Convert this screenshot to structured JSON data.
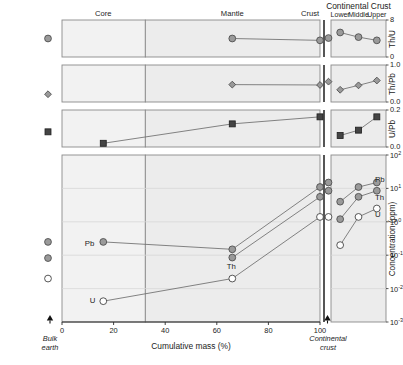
{
  "figure": {
    "title": "",
    "group_header": "Continental Crust",
    "reservoir_labels": [
      {
        "text": "Core",
        "x_pct": 16
      },
      {
        "text": "Mantle",
        "x_pct": 66
      },
      {
        "text": "Crust",
        "x_pct": 100
      }
    ],
    "cc_sublabels": [
      "Lower",
      "Middle",
      "Upper"
    ],
    "xaxis": {
      "label": "Cumulative mass (%)",
      "ticks": [
        "0",
        "20",
        "40",
        "60",
        "80",
        "100"
      ],
      "tick_values": [
        0,
        20,
        40,
        60,
        80,
        100
      ],
      "range": [
        0,
        100
      ],
      "left_endpoint_label": [
        "Bulk",
        "earth"
      ],
      "right_endpoint_label": [
        "Continental",
        "crust"
      ]
    },
    "panel_divider_x_pct": 32.3,
    "point_labels": [
      "Pb",
      "Th",
      "U"
    ],
    "legend_note": ""
  },
  "chart_data": [
    {
      "id": "th-u",
      "type": "line",
      "title": "",
      "ylabel": "Th/U",
      "ylim": [
        0,
        8
      ],
      "yticks": [
        0,
        8
      ],
      "ytick_labels": [
        "0",
        "8"
      ],
      "grid": false,
      "xlabel": "",
      "xlim": [
        0,
        100
      ],
      "marker": "filled-circle",
      "series": [
        {
          "name": "Th/U main",
          "x": [
            66,
            100
          ],
          "y": [
            4.0,
            3.6
          ],
          "x_labels": [
            "Mantle",
            "Crust"
          ]
        }
      ],
      "bulk_earth_point": {
        "y": 4.0
      },
      "crust_extra_point": {
        "y": 4.1
      },
      "cc_panel": {
        "categories": [
          "Lower",
          "Middle",
          "Upper"
        ],
        "values": [
          5.3,
          4.3,
          3.6
        ]
      }
    },
    {
      "id": "th-pb",
      "type": "line",
      "title": "",
      "ylabel": "Th/Pb",
      "ylim": [
        0.0,
        1.0
      ],
      "yticks": [
        0.0,
        1.0
      ],
      "ytick_labels": [
        "0.0",
        "1.0"
      ],
      "grid": false,
      "xlabel": "",
      "xlim": [
        0,
        100
      ],
      "marker": "filled-diamond",
      "series": [
        {
          "name": "Th/Pb main",
          "x": [
            66,
            100
          ],
          "y": [
            0.47,
            0.46
          ],
          "x_labels": [
            "Mantle",
            "Crust"
          ]
        }
      ],
      "bulk_earth_point": {
        "y": 0.21
      },
      "crust_extra_point": {
        "y": 0.55
      },
      "cc_panel": {
        "categories": [
          "Lower",
          "Middle",
          "Upper"
        ],
        "values": [
          0.33,
          0.45,
          0.58
        ]
      }
    },
    {
      "id": "u-pb",
      "type": "line",
      "title": "",
      "ylabel": "U/Pb",
      "ylim": [
        0.0,
        0.2
      ],
      "yticks": [
        0.0,
        0.2
      ],
      "ytick_labels": [
        "0.0",
        "0.2"
      ],
      "grid": false,
      "xlabel": "",
      "xlim": [
        0,
        100
      ],
      "marker": "filled-square",
      "series": [
        {
          "name": "U/Pb main",
          "x": [
            16,
            66,
            100
          ],
          "y": [
            0.02,
            0.125,
            0.163
          ],
          "x_labels": [
            "Core",
            "Mantle",
            "Crust"
          ]
        }
      ],
      "bulk_earth_point": {
        "y": 0.082
      },
      "cc_panel": {
        "categories": [
          "Lower",
          "Middle",
          "Upper"
        ],
        "values": [
          0.062,
          0.091,
          0.163
        ]
      }
    },
    {
      "id": "concentration",
      "type": "line",
      "title": "",
      "ylabel": "Concentration (ppm)",
      "yscale": "log",
      "ylim": [
        0.001,
        100
      ],
      "yticks": [
        0.001,
        0.01,
        0.1,
        1,
        10,
        100
      ],
      "ytick_labels": [
        "10-3",
        "10-2",
        "10-1",
        "100",
        "101",
        "102"
      ],
      "ytick_exponents": [
        "-3",
        "-2",
        "-1",
        "0",
        "1",
        "2"
      ],
      "grid": true,
      "xlabel": "Cumulative mass (%)",
      "xlim": [
        0,
        100
      ],
      "series": [
        {
          "name": "Pb",
          "marker": "filled-circle",
          "x": [
            16,
            66,
            100
          ],
          "y": [
            0.25,
            0.15,
            11.0
          ],
          "label": "Pb"
        },
        {
          "name": "Th",
          "marker": "filled-circle",
          "x": [
            66,
            100
          ],
          "y": [
            0.085,
            5.6
          ],
          "label": "Th"
        },
        {
          "name": "U",
          "marker": "open-circle",
          "x": [
            16,
            66,
            100
          ],
          "y": [
            0.0042,
            0.02,
            1.4
          ],
          "label": "U"
        }
      ],
      "bulk_earth_points": [
        {
          "name": "Pb",
          "marker": "filled-circle",
          "y": 0.25
        },
        {
          "name": "Th",
          "marker": "filled-circle",
          "y": 0.082
        },
        {
          "name": "U",
          "marker": "open-circle",
          "y": 0.02
        }
      ],
      "crust_extra_points": [
        {
          "name": "Pb",
          "marker": "filled-circle",
          "y": 15.0
        },
        {
          "name": "Th",
          "marker": "filled-circle",
          "y": 8.5
        },
        {
          "name": "U",
          "marker": "open-circle",
          "y": 1.4
        }
      ],
      "cc_panel": {
        "categories": [
          "Lower",
          "Middle",
          "Upper"
        ],
        "series": [
          {
            "name": "Pb",
            "marker": "filled-circle",
            "values": [
              4.0,
              11.0,
              15.0
            ]
          },
          {
            "name": "Th",
            "marker": "filled-circle",
            "values": [
              1.2,
              5.6,
              8.5
            ]
          },
          {
            "name": "U",
            "marker": "open-circle",
            "values": [
              0.2,
              1.4,
              2.5
            ]
          }
        ]
      }
    }
  ],
  "style": {
    "panel_fill": "#ececec",
    "panel_fill_core": "#f2f2f2",
    "panel_stroke": "#8a8a8a",
    "marker_fill": "#9a9a9a",
    "marker_stroke": "#4a4a4a",
    "open_fill": "#ffffff",
    "line_color": "#6e6e6e",
    "grid_color": "#d8d8d8",
    "axis_color": "#2b2b2b",
    "text_color": "#1c1c1c"
  }
}
